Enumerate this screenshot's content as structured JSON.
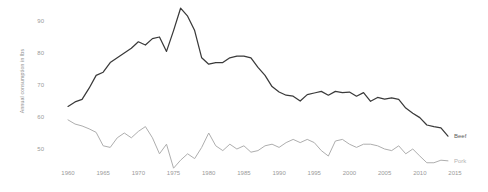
{
  "chart_data": {
    "type": "line",
    "title": "",
    "xlabel": "",
    "ylabel": "Annual consumption in lbs",
    "xlim": [
      1960,
      2016
    ],
    "ylim": [
      44,
      95
    ],
    "grid": false,
    "legend_position": "right-end-of-line",
    "xticks": [
      1960,
      1965,
      1970,
      1975,
      1980,
      1985,
      1990,
      1995,
      2000,
      2005,
      2010,
      2015
    ],
    "yticks": [
      50,
      60,
      70,
      80,
      90
    ],
    "x": [
      1960,
      1961,
      1962,
      1963,
      1964,
      1965,
      1966,
      1967,
      1968,
      1969,
      1970,
      1971,
      1972,
      1973,
      1974,
      1975,
      1976,
      1977,
      1978,
      1979,
      1980,
      1981,
      1982,
      1983,
      1984,
      1985,
      1986,
      1987,
      1988,
      1989,
      1990,
      1991,
      1992,
      1993,
      1994,
      1995,
      1996,
      1997,
      1998,
      1999,
      2000,
      2001,
      2002,
      2003,
      2004,
      2005,
      2006,
      2007,
      2008,
      2009,
      2010,
      2011,
      2012,
      2013,
      2014
    ],
    "series": [
      {
        "name": "Beef",
        "color": "#3a3a3a",
        "values": [
          63.3,
          64.7,
          65.5,
          69.0,
          73.0,
          74.0,
          77.0,
          78.5,
          80.0,
          81.5,
          83.5,
          82.5,
          84.5,
          85.0,
          80.5,
          87.0,
          94.0,
          91.5,
          87.0,
          78.5,
          76.5,
          77.0,
          77.0,
          78.5,
          79.0,
          79.0,
          78.5,
          75.5,
          73.0,
          69.5,
          67.8,
          66.8,
          66.5,
          65.0,
          67.0,
          67.5,
          68.0,
          66.8,
          68.0,
          67.6,
          67.8,
          66.5,
          67.6,
          64.9,
          66.1,
          65.6,
          66.0,
          65.5,
          62.8,
          61.2,
          59.8,
          57.5,
          57.0,
          56.6,
          54.0
        ]
      },
      {
        "name": "Pork",
        "color": "#aeaeae",
        "values": [
          59.1,
          57.8,
          57.2,
          56.3,
          55.2,
          51.0,
          50.5,
          53.5,
          55.0,
          53.5,
          55.5,
          57.0,
          53.5,
          48.5,
          51.5,
          44.0,
          46.5,
          48.5,
          47.0,
          50.5,
          55.0,
          51.0,
          49.5,
          51.5,
          50.0,
          51.0,
          49.0,
          49.5,
          51.0,
          51.5,
          50.5,
          52.0,
          53.0,
          52.0,
          53.0,
          52.0,
          49.5,
          47.8,
          52.5,
          53.0,
          51.5,
          50.5,
          51.5,
          51.5,
          51.0,
          50.0,
          49.5,
          51.0,
          48.5,
          50.0,
          47.8,
          45.7,
          45.7,
          46.5,
          46.3
        ]
      }
    ],
    "annotations": [
      {
        "text": "Beef",
        "near_x": 2014,
        "near_y": 54.0
      },
      {
        "text": "Pork",
        "near_x": 2014,
        "near_y": 46.3
      }
    ]
  }
}
